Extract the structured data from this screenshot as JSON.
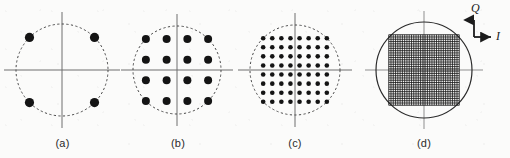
{
  "figure": {
    "background_color": "#fbfbfa",
    "width": 510,
    "height": 158
  },
  "axis_legend": {
    "name": "iq-axis-legend",
    "q_label": "Q",
    "i_label": "I",
    "color": "#1c1c1c"
  },
  "chart_data": {
    "type": "scatter",
    "xlabel": "I",
    "ylabel": "Q",
    "grid": false,
    "legend_position": "top-right",
    "panels": [
      {
        "label": "(a)",
        "name": "constellation-qpsk",
        "scheme": "4-PSK",
        "point_count": 4,
        "grid_size": 2,
        "boundary": "circle",
        "boundary_style": "dashed",
        "boundary_radius": 46,
        "center_x": 62,
        "center_y": 70,
        "dot_radius": 4.6,
        "dot_color": "#141414",
        "axis_color": "#6e6e6e",
        "points": [
          {
            "x": -0.7071,
            "y": 0.7071
          },
          {
            "x": 0.7071,
            "y": 0.7071
          },
          {
            "x": -0.7071,
            "y": -0.7071
          },
          {
            "x": 0.7071,
            "y": -0.7071
          }
        ]
      },
      {
        "label": "(b)",
        "name": "constellation-16qam",
        "scheme": "16-QAM",
        "point_count": 16,
        "grid_size": 4,
        "boundary": "circle",
        "boundary_style": "dashed",
        "boundary_radius": 44,
        "center_x": 177,
        "center_y": 70,
        "dot_radius": 4.0,
        "dot_color": "#141414",
        "axis_color": "#6e6e6e",
        "spacing": 0.6667,
        "offset": 1.0
      },
      {
        "label": "(c)",
        "name": "constellation-64qam",
        "scheme": "64-QAM",
        "point_count": 64,
        "grid_size": 8,
        "boundary": "circle",
        "boundary_style": "dashed",
        "boundary_radius": 45,
        "center_x": 295,
        "center_y": 70,
        "dot_radius": 2.3,
        "dot_color": "#141414",
        "axis_color": "#6e6e6e",
        "spacing": 0.2857,
        "offset": 1.0
      },
      {
        "label": "(d)",
        "name": "constellation-dense-qam",
        "scheme": "dense QAM",
        "point_count": 1024,
        "grid_size": 32,
        "boundary": "circle",
        "boundary_style": "solid",
        "boundary_radius": 48,
        "center_x": 424,
        "center_y": 70,
        "dot_radius": 0.62,
        "dot_color": "#1a1a1a",
        "axis_color": "#8f8f8f",
        "spacing": 0.0645,
        "offset": 1.0
      }
    ]
  }
}
